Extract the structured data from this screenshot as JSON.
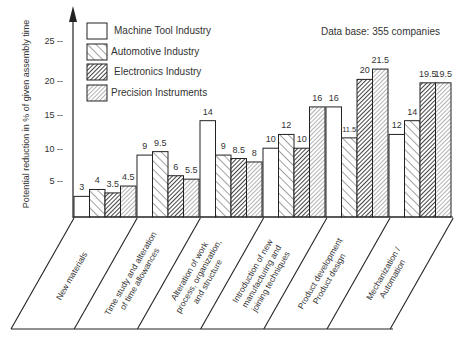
{
  "chart_data": {
    "type": "bar",
    "title": "",
    "annotation": "Data base:  355  companies",
    "xlabel": "",
    "ylabel": "Potential reduction in % of given assembly time",
    "ylim": [
      0,
      27
    ],
    "yticks": [
      5,
      10,
      15,
      20,
      25
    ],
    "grid": false,
    "legend_position": "top-left (inside plot)",
    "categories": [
      "New materials",
      "Time study and alteration of time allowances",
      "Alteration of work process, organization, and structure",
      "Introduction of new manufacturing and joining techniques",
      "Product development / Product design",
      "Mechanization / Automation"
    ],
    "category_lines": [
      [
        "New   materials"
      ],
      [
        "Time study and alteration",
        "of time allowances"
      ],
      [
        "Alteration  of  work",
        "process,  organization,",
        "and  structure"
      ],
      [
        "Introduction  of  new",
        "manufacturing  and",
        "joining  techniques"
      ],
      [
        "Product  development",
        "Product  design"
      ],
      [
        "Mechanization /",
        "Automation"
      ]
    ],
    "series": [
      {
        "name": "Machine Tool Industry",
        "pattern": "white",
        "values": [
          3,
          9,
          14,
          10,
          16,
          12
        ]
      },
      {
        "name": "Automotive Industry",
        "pattern": "wide-hatch",
        "values": [
          4,
          9.5,
          9,
          12,
          11.5,
          14
        ]
      },
      {
        "name": "Electronics Industry",
        "pattern": "dense-dark-hatch",
        "values": [
          3.5,
          6,
          8.5,
          10,
          20,
          19.5
        ]
      },
      {
        "name": "Precision Instruments",
        "pattern": "dense-light-hatch",
        "values": [
          4.5,
          5.5,
          8,
          16,
          21.5,
          19.5
        ]
      }
    ],
    "value_labels": [
      [
        "3",
        "4",
        "3.5",
        "4.5"
      ],
      [
        "9",
        "9.5",
        "6",
        "5.5"
      ],
      [
        "14",
        "9",
        "8.5",
        "8"
      ],
      [
        "10",
        "12",
        "10",
        "16"
      ],
      [
        "16",
        "11.5",
        "20",
        "21.5"
      ],
      [
        "12",
        "14",
        "19.5",
        "19.5"
      ]
    ]
  }
}
